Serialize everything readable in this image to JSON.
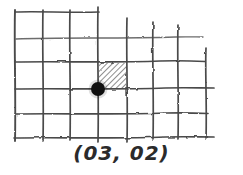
{
  "figure": {
    "caption": "(03, 02)",
    "style": "pencil-sketch",
    "background_color": "#ffffff",
    "ink_color": "#3a3a3a",
    "dot_color": "#111111",
    "hatch_color": "#4a4a4a"
  },
  "grid": {
    "columns": 7,
    "rows": 5,
    "vertical_line_x": [
      15,
      43,
      70,
      98,
      127,
      153,
      178,
      205
    ],
    "horizontal_line_y": [
      12,
      38,
      62,
      88,
      113,
      137
    ],
    "vertical_overshoot_top": 8,
    "vertical_overshoot_bottom": 5,
    "jitter": 1.6
  },
  "shaded_cell": {
    "col": 3,
    "row": 2,
    "x": 98,
    "y": 62,
    "width": 29,
    "height": 26,
    "hatch_spacing": 4,
    "hatch_angle_deg": 45
  },
  "marked_point": {
    "label": "(03, 02)",
    "col": 3,
    "row": 2,
    "x": 98,
    "y": 88,
    "radius": 7
  },
  "caption": {
    "text": "(03, 02)"
  }
}
